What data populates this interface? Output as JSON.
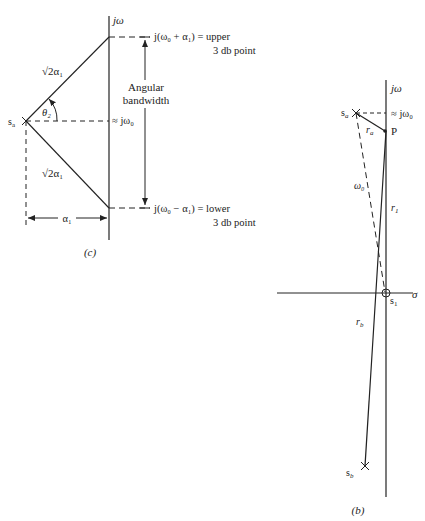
{
  "figure_c": {
    "caption": "(c)",
    "axis_label": "jω",
    "pole_label": "s",
    "pole_sub": "a",
    "upper_point": "j(ω₀ + α₁)  =  upper",
    "upper_point_line2": "3 db point",
    "center_label": "≈ jω₀",
    "lower_point": "j(ω₀ − α₁)  =  lower",
    "lower_point_line2": "3 db point",
    "bandwidth_line1": "Angular",
    "bandwidth_line2": "bandwidth",
    "upper_segment_label": "√2α₁",
    "lower_segment_label": "√2α₁",
    "angle_label": "θ₂",
    "horizontal_dim_label": "α₁"
  },
  "figure_b": {
    "caption": "(b)",
    "axis_label": "jω",
    "real_axis_label": "σ",
    "pole_a_label": "s",
    "pole_a_sub": "a",
    "pole_b_label": "s",
    "pole_b_sub": "b",
    "zero_label": "s",
    "zero_sub": "1",
    "point_label": "P",
    "center_label": "≈ jω₀",
    "ra_label": "r",
    "ra_sub": "a",
    "rb_label": "r",
    "rb_sub": "b",
    "r1_label": "r",
    "r1_sub": "1",
    "omega_label": "ω₀"
  },
  "colors": {
    "ink": "#222222",
    "background": "#ffffff"
  }
}
